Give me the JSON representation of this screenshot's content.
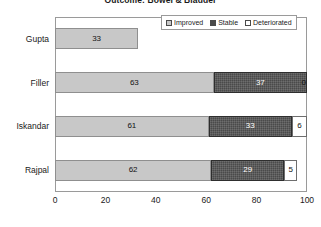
{
  "chart": {
    "title": "Outcome: Bowel & Bladder",
    "xlabel": "",
    "ylabel": ""
  },
  "legend": {
    "position": "top-right",
    "items": [
      {
        "label": "Improved",
        "swatch": "improved-swatch",
        "color": "#c8c8c8"
      },
      {
        "label": "Stable",
        "swatch": "stable-swatch",
        "color": "#4a4a4a"
      },
      {
        "label": "Deteriorated",
        "swatch": "deteriorated-swatch",
        "color": "#ffffff"
      }
    ]
  },
  "axis": {
    "xticks": [
      "0",
      "20",
      "40",
      "60",
      "80",
      "100"
    ],
    "xmin": 0,
    "xmax": 100
  },
  "rows": [
    {
      "category": "Gupta",
      "segments": [
        {
          "series": "Improved",
          "value": 33,
          "label": "33"
        }
      ]
    },
    {
      "category": "Filler",
      "segments": [
        {
          "series": "Improved",
          "value": 63,
          "label": "63"
        },
        {
          "series": "Stable",
          "value": 37,
          "label": "37"
        },
        {
          "series": "Deteriorated",
          "value": 0,
          "label": "0"
        }
      ]
    },
    {
      "category": "Iskandar",
      "segments": [
        {
          "series": "Improved",
          "value": 61,
          "label": "61"
        },
        {
          "series": "Stable",
          "value": 33,
          "label": "33"
        },
        {
          "series": "Deteriorated",
          "value": 6,
          "label": "6"
        }
      ]
    },
    {
      "category": "Rajpal",
      "segments": [
        {
          "series": "Improved",
          "value": 62,
          "label": "62"
        },
        {
          "series": "Stable",
          "value": 29,
          "label": "29"
        },
        {
          "series": "Deteriorated",
          "value": 5,
          "label": "5"
        }
      ]
    }
  ],
  "chart_data": {
    "type": "bar",
    "orientation": "horizontal",
    "stacked": true,
    "title": "Outcome: Bowel & Bladder",
    "xlabel": "",
    "ylabel": "",
    "xlim": [
      0,
      100
    ],
    "xticks": [
      0,
      20,
      40,
      60,
      80,
      100
    ],
    "grid": false,
    "legend_position": "top-right",
    "categories": [
      "Gupta",
      "Filler",
      "Iskandar",
      "Rajpal"
    ],
    "series": [
      {
        "name": "Improved",
        "color": "#c8c8c8",
        "values": [
          33,
          63,
          61,
          62
        ]
      },
      {
        "name": "Stable",
        "color": "#4a4a4a",
        "values": [
          null,
          37,
          33,
          29
        ]
      },
      {
        "name": "Deteriorated",
        "color": "#ffffff",
        "values": [
          null,
          0,
          6,
          5
        ]
      }
    ]
  }
}
